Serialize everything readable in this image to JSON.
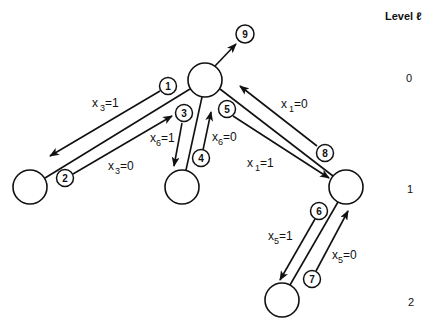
{
  "level_header": "Level ℓ",
  "levels": [
    "0",
    "1",
    "2"
  ],
  "tree_nodes": [
    {
      "id": "root",
      "level": 0
    },
    {
      "id": "left",
      "level": 1
    },
    {
      "id": "middle",
      "level": 1
    },
    {
      "id": "right",
      "level": 1
    },
    {
      "id": "bottom",
      "level": 2
    }
  ],
  "tree_edges": [
    {
      "from": "root",
      "to": "left"
    },
    {
      "from": "root",
      "to": "middle"
    },
    {
      "from": "root",
      "to": "right"
    },
    {
      "from": "right",
      "to": "bottom"
    }
  ],
  "steps": [
    {
      "num": "1",
      "var": "x",
      "sub": "3",
      "value": "1",
      "direction": "down"
    },
    {
      "num": "2",
      "var": "x",
      "sub": "3",
      "value": "0",
      "direction": "up"
    },
    {
      "num": "3",
      "var": "x",
      "sub": "6",
      "value": "1",
      "direction": "down"
    },
    {
      "num": "4",
      "var": "x",
      "sub": "6",
      "value": "0",
      "direction": "up"
    },
    {
      "num": "5",
      "var": "x",
      "sub": "1",
      "value": "1",
      "direction": "down"
    },
    {
      "num": "6",
      "var": "x",
      "sub": "5",
      "value": "1",
      "direction": "down"
    },
    {
      "num": "7",
      "var": "x",
      "sub": "5",
      "value": "0",
      "direction": "up"
    },
    {
      "num": "8",
      "var": "x",
      "sub": "1",
      "value": "0",
      "direction": "up"
    },
    {
      "num": "9",
      "direction": "exit"
    }
  ]
}
